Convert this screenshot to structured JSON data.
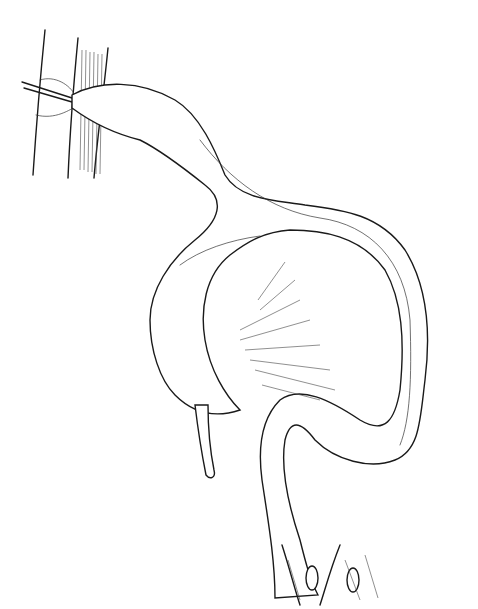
{
  "illustration": {
    "subject": "surgical anatomical line drawing of colon",
    "background_color": "#ffffff",
    "line_color": "#1a1a1a",
    "labels": []
  }
}
